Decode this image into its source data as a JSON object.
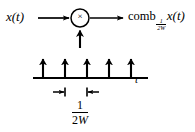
{
  "figure": {
    "type": "block-diagram",
    "background_color": "#ffffff",
    "stroke_color": "#000000"
  },
  "labels": {
    "input_signal": "x(t)",
    "multiplier_symbol": "×",
    "output_prefix": "comb",
    "output_subscript_numerator": "1",
    "output_subscript_denominator": "2W",
    "output_subscript_text": "½W",
    "output_suffix": "x(t)",
    "output_full": "comb½W x(t)",
    "axis_label": "t",
    "period_numerator": "1",
    "period_denominator_two": "2",
    "period_denominator_w": "W",
    "period_full": "1/2W"
  },
  "impulse_train": {
    "count": 5,
    "x_positions": [
      43,
      65,
      87,
      109,
      131
    ],
    "baseline_y": 78,
    "tip_y": 57,
    "axis_start_x": 33,
    "axis_end_x": 148
  },
  "dimension_marker": {
    "left_tick_x": 65,
    "right_tick_x": 87,
    "y": 92,
    "label": "1/2W"
  },
  "multiplier_node": {
    "center_x": 80,
    "center_y": 18,
    "radius": 9
  },
  "arrows": {
    "input_arrow": {
      "from_x": 38,
      "to_x": 70,
      "y": 18
    },
    "output_arrow": {
      "from_x": 90,
      "to_x": 124,
      "y": 18
    },
    "comb_arrow": {
      "x": 80,
      "from_y": 48,
      "to_y": 29
    }
  }
}
